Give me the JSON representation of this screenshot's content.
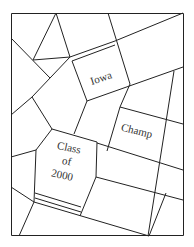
{
  "diagram": {
    "type": "street-map puzzle",
    "line_color": "#222222",
    "background": "#ffffff",
    "labels": {
      "iowa": "Iowa",
      "champ": "Champ",
      "class_line1": "Class",
      "class_line2": "of",
      "class_line3": "2000"
    }
  }
}
